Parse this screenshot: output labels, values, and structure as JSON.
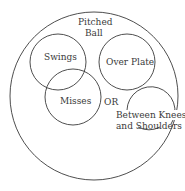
{
  "diagram": {
    "type": "venn",
    "stroke_color": "#3a3a3a",
    "background": "#ffffff",
    "labels": {
      "outer_line1": "Pitched",
      "outer_line2": "Ball",
      "swings": "Swings",
      "misses": "Misses",
      "or": "OR",
      "over_plate": "Over Plate",
      "knees_line1": "Between Knees",
      "knees_line2": "and Shoulders"
    },
    "sets": [
      {
        "name": "Pitched Ball",
        "cx": 94,
        "cy": 96,
        "r": 84
      },
      {
        "name": "Swings",
        "cx": 58,
        "cy": 62,
        "r": 28
      },
      {
        "name": "Misses",
        "cx": 73,
        "cy": 97,
        "r": 28
      },
      {
        "name": "Over Plate",
        "cx": 127,
        "cy": 62,
        "r": 28
      },
      {
        "name": "Between Knees and Shoulders",
        "cx": 149,
        "cy": 106,
        "r": 24
      }
    ]
  }
}
